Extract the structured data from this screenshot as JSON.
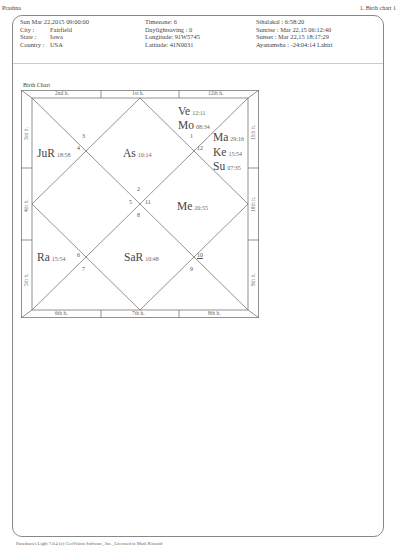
{
  "header": {
    "title": "Prashna",
    "page_label": "1. Birth chart 1"
  },
  "info": {
    "col1": [
      {
        "label": "",
        "value": "Sun Mar 22,2015  09:00:00"
      },
      {
        "label": "City :",
        "value": "Fairfield"
      },
      {
        "label": "State :",
        "value": "Iowa"
      },
      {
        "label": "Country :",
        "value": "USA"
      }
    ],
    "col2": [
      "Timezone: 6",
      "Daylightsaving : 0",
      "Longitude: 91W5745",
      "Latitude: 41N0031"
    ],
    "col3": [
      "Sthalakal : 6:58:20",
      "Sunrise : Mar 22,15  06:12:40",
      "Sunset : Mar 22,15  18:17:29",
      "Ayanamsha : -24:04:14 Lahiri"
    ]
  },
  "chart": {
    "title": "Birth Chart",
    "top_labels": [
      "2nd h.",
      "1st h.",
      "12th h."
    ],
    "bottom_labels": [
      "6th h.",
      "7th h.",
      "8th h."
    ],
    "left_labels": [
      "3rd h.",
      "4th h.",
      "5th h."
    ],
    "right_labels": [
      "11th h.",
      "10th h.",
      "9th h."
    ],
    "planets": [
      {
        "name": "Ve",
        "deg": "12:11"
      },
      {
        "name": "Mo",
        "deg": "08:34"
      },
      {
        "name": "Ma",
        "deg": "29:16"
      },
      {
        "name": "Ke",
        "deg": "15:54"
      },
      {
        "name": "Su",
        "deg": "07:35"
      },
      {
        "name": "JuR",
        "deg": "18:58"
      },
      {
        "name": "As",
        "deg": "10:14"
      },
      {
        "name": "Me",
        "deg": "20:55"
      },
      {
        "name": "Ra",
        "deg": "15:54"
      },
      {
        "name": "SaR",
        "deg": "10:48"
      }
    ],
    "house_numbers": {
      "h1": "1",
      "h2": "2",
      "h3": "3",
      "h4": "4",
      "h5": "5",
      "h6": "6",
      "h7": "7",
      "h8": "8",
      "h9": "9",
      "h10": "10",
      "h11": "11",
      "h12": "12"
    }
  },
  "footer": {
    "text": "Parashara's Light 7.0.4  (c) GeoVision Software, Inc., Licensed to Mark Kincaid"
  }
}
